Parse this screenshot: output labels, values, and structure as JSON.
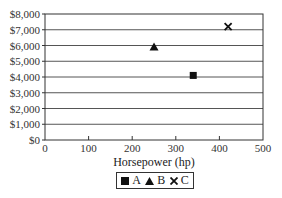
{
  "chart_data": {
    "type": "scatter",
    "title": "",
    "xlabel": "Horsepower (hp)",
    "ylabel": "",
    "xlim": [
      0,
      500
    ],
    "ylim": [
      0,
      8000
    ],
    "x_ticks": [
      0,
      100,
      200,
      300,
      400,
      500
    ],
    "x_tick_labels": [
      "0",
      "100",
      "200",
      "300",
      "400",
      "500"
    ],
    "y_ticks": [
      0,
      1000,
      2000,
      3000,
      4000,
      5000,
      6000,
      7000,
      8000
    ],
    "y_tick_labels": [
      "$0",
      "$1,000",
      "$2,000",
      "$3,000",
      "$4,000",
      "$5,000",
      "$6,000",
      "$7,000",
      "$8,000"
    ],
    "grid": {
      "horizontal": true,
      "vertical": false
    },
    "legend_position": "bottom",
    "series": [
      {
        "name": "A",
        "marker": "square",
        "x": [
          340
        ],
        "y": [
          4100
        ]
      },
      {
        "name": "B",
        "marker": "triangle",
        "x": [
          250
        ],
        "y": [
          5900
        ]
      },
      {
        "name": "C",
        "marker": "x",
        "x": [
          420
        ],
        "y": [
          7200
        ]
      }
    ]
  },
  "legend": {
    "items": [
      {
        "label": "A",
        "marker": "square"
      },
      {
        "label": "B",
        "marker": "triangle"
      },
      {
        "label": "C",
        "marker": "x"
      }
    ]
  },
  "colors": {
    "marker": "#111111",
    "axis": "#333333",
    "grid": "#555555"
  }
}
